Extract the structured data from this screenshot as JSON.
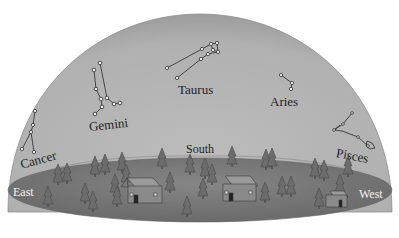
{
  "colors": {
    "dome": "#b4b4b4",
    "dome_edge": "#9a9a9a",
    "ground": "#7c7c7c",
    "ground_dark": "#5e5e5e",
    "star_fill": "#ffffff",
    "line": "#2a2a2a"
  },
  "constellations": [
    {
      "name": "Cancer",
      "label": "Cancer"
    },
    {
      "name": "Gemini",
      "label": "Gemini"
    },
    {
      "name": "Taurus",
      "label": "Taurus"
    },
    {
      "name": "Aries",
      "label": "Aries"
    },
    {
      "name": "Pisces",
      "label": "Pisces"
    }
  ],
  "directions": {
    "east": "East",
    "south": "South",
    "west": "West"
  }
}
